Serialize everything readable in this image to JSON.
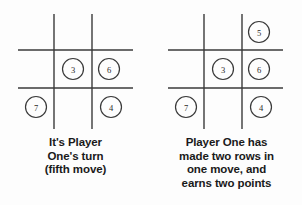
{
  "figure": {
    "background_color": "#fdfdfd",
    "line_color": "#3a3a3a",
    "text_color": "#1a1a1a"
  },
  "panels": [
    {
      "id": "before-move",
      "board": {
        "name": "tic-tac-toe-grid",
        "rows": 3,
        "columns": 3,
        "marks": [
          {
            "cell": "top-left",
            "value": ""
          },
          {
            "cell": "top-center",
            "value": ""
          },
          {
            "cell": "top-right",
            "value": ""
          },
          {
            "cell": "middle-left",
            "value": ""
          },
          {
            "cell": "middle-center",
            "value": "3"
          },
          {
            "cell": "middle-right",
            "value": "6"
          },
          {
            "cell": "bottom-left",
            "value": "7"
          },
          {
            "cell": "bottom-center",
            "value": ""
          },
          {
            "cell": "bottom-right",
            "value": "4"
          }
        ]
      },
      "caption": {
        "lines": [
          "It's Player",
          "One's turn",
          "(fifth move)"
        ]
      }
    },
    {
      "id": "after-move",
      "board": {
        "name": "tic-tac-toe-grid",
        "rows": 3,
        "columns": 3,
        "marks": [
          {
            "cell": "top-left",
            "value": ""
          },
          {
            "cell": "top-center",
            "value": ""
          },
          {
            "cell": "top-right",
            "value": "5"
          },
          {
            "cell": "middle-left",
            "value": ""
          },
          {
            "cell": "middle-center",
            "value": "3"
          },
          {
            "cell": "middle-right",
            "value": "6"
          },
          {
            "cell": "bottom-left",
            "value": "7"
          },
          {
            "cell": "bottom-center",
            "value": ""
          },
          {
            "cell": "bottom-right",
            "value": "4"
          }
        ]
      },
      "caption": {
        "lines": [
          "Player One has",
          "made two rows in",
          "one move, and",
          "earns two points"
        ]
      }
    }
  ]
}
